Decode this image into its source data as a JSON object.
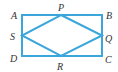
{
  "diagram": {
    "type": "geometry",
    "stroke_color": "#3aa6db",
    "label_color": "#333333",
    "rectangle": {
      "vertices": [
        "A",
        "B",
        "C",
        "D"
      ]
    },
    "inner_quadrilateral": {
      "vertices": [
        "P",
        "Q",
        "R",
        "S"
      ]
    },
    "labels": {
      "A": "A",
      "B": "B",
      "C": "C",
      "D": "D",
      "P": "P",
      "Q": "Q",
      "R": "R",
      "S": "S"
    }
  }
}
